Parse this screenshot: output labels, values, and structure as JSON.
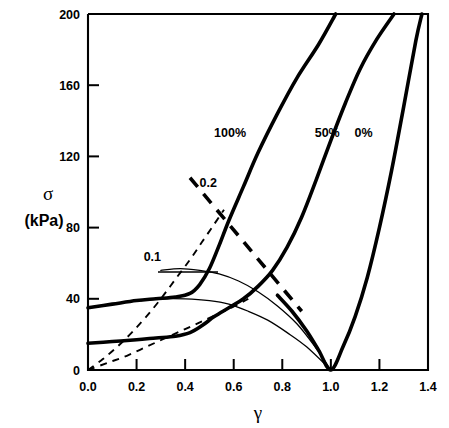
{
  "chart_data": {
    "type": "line",
    "title": "",
    "xlabel": "γ",
    "ylabel_symbol": "σ",
    "ylabel_units": "(kPa)",
    "xlim": [
      0.0,
      1.4
    ],
    "ylim": [
      0,
      200
    ],
    "xticks": [
      "0.0",
      "0.2",
      "0.4",
      "0.6",
      "0.8",
      "1.0",
      "1.2",
      "1.4"
    ],
    "xtick_values": [
      0.0,
      0.2,
      0.4,
      0.6,
      0.8,
      1.0,
      1.2,
      1.4
    ],
    "yticks": [
      "0",
      "40",
      "80",
      "120",
      "160",
      "200"
    ],
    "ytick_values": [
      0,
      40,
      80,
      120,
      160,
      200
    ],
    "grid": false,
    "legend": "inline-annotations",
    "annotations": [
      {
        "text": "100%",
        "x": 0.585,
        "y": 131,
        "style": "bold"
      },
      {
        "text": "50%",
        "x": 0.985,
        "y": 131,
        "style": "bold"
      },
      {
        "text": "0%",
        "x": 1.135,
        "y": 131,
        "style": "bold"
      },
      {
        "text": "0.2",
        "x": 0.495,
        "y": 103,
        "style": "bold"
      },
      {
        "text": "0.1",
        "x": 0.265,
        "y": 61,
        "style": "bold"
      }
    ],
    "series": [
      {
        "name": "100%",
        "style": "thick-solid",
        "comment": "saturation 100% - rises steeply after gamma 0.45",
        "points": [
          [
            0.0,
            35
          ],
          [
            0.1,
            37
          ],
          [
            0.2,
            39
          ],
          [
            0.28,
            40
          ],
          [
            0.36,
            41
          ],
          [
            0.42,
            43
          ],
          [
            0.46,
            48
          ],
          [
            0.5,
            57
          ],
          [
            0.54,
            70
          ],
          [
            0.58,
            84
          ],
          [
            0.64,
            103
          ],
          [
            0.7,
            122
          ],
          [
            0.78,
            144
          ],
          [
            0.86,
            164
          ],
          [
            0.95,
            183
          ],
          [
            1.02,
            200
          ]
        ]
      },
      {
        "name": "50%",
        "style": "thick-solid",
        "comment": "saturation 50% - dips to 0 at gamma=1 then rises",
        "points": [
          [
            0.0,
            15
          ],
          [
            0.1,
            16
          ],
          [
            0.2,
            17
          ],
          [
            0.28,
            18
          ],
          [
            0.36,
            19
          ],
          [
            0.42,
            21
          ],
          [
            0.47,
            25
          ],
          [
            0.52,
            30
          ],
          [
            0.58,
            35
          ],
          [
            0.64,
            40
          ],
          [
            0.7,
            47
          ],
          [
            0.76,
            56
          ],
          [
            0.82,
            69
          ],
          [
            0.88,
            86
          ],
          [
            0.94,
            107
          ],
          [
            1.0,
            129
          ],
          [
            1.06,
            150
          ],
          [
            1.12,
            169
          ],
          [
            1.19,
            186
          ],
          [
            1.26,
            200
          ]
        ]
      },
      {
        "name": "0%",
        "style": "thick-solid",
        "comment": "saturation 0% - reaches zero at gamma=1 then rises steeply",
        "points": [
          [
            0.78,
            42
          ],
          [
            0.84,
            33
          ],
          [
            0.9,
            22
          ],
          [
            0.95,
            11
          ],
          [
            1.0,
            0
          ],
          [
            1.05,
            13
          ],
          [
            1.1,
            30
          ],
          [
            1.15,
            52
          ],
          [
            1.2,
            80
          ],
          [
            1.25,
            112
          ],
          [
            1.3,
            148
          ],
          [
            1.35,
            185
          ],
          [
            1.375,
            200
          ]
        ]
      },
      {
        "name": "thin-upper-envelope",
        "style": "thin-solid",
        "comment": "thin curve labelled 0.1, peaks ~57 near gamma 0.35, decays to 0 at gamma 1",
        "points": [
          [
            0.3,
            56
          ],
          [
            0.38,
            57
          ],
          [
            0.46,
            56
          ],
          [
            0.54,
            54
          ],
          [
            0.62,
            50
          ],
          [
            0.7,
            44
          ],
          [
            0.78,
            36
          ],
          [
            0.86,
            26
          ],
          [
            0.93,
            14
          ],
          [
            1.0,
            0
          ]
        ]
      },
      {
        "name": "thin-lower-envelope",
        "style": "thin-solid",
        "comment": "thin curve peaking ~40 near gamma 0.27, decays to 0 at gamma 1",
        "points": [
          [
            0.22,
            39
          ],
          [
            0.3,
            40
          ],
          [
            0.4,
            40
          ],
          [
            0.5,
            39
          ],
          [
            0.58,
            37
          ],
          [
            0.66,
            33
          ],
          [
            0.74,
            28
          ],
          [
            0.82,
            21
          ],
          [
            0.9,
            13
          ],
          [
            1.0,
            0
          ]
        ]
      },
      {
        "name": "fine-dashed-upper",
        "style": "fine-dashed",
        "comment": "light dashed line from origin rising steeply, crosses 100% curve near gamma 0.5",
        "points": [
          [
            0.0,
            0
          ],
          [
            0.06,
            6
          ],
          [
            0.12,
            13
          ],
          [
            0.18,
            21
          ],
          [
            0.24,
            30
          ],
          [
            0.3,
            40
          ],
          [
            0.36,
            51
          ],
          [
            0.42,
            62
          ],
          [
            0.47,
            72
          ],
          [
            0.52,
            82
          ],
          [
            0.56,
            90
          ]
        ]
      },
      {
        "name": "fine-dashed-lower",
        "style": "fine-dashed",
        "comment": "light dashed line from origin with lower slope, crosses 50% curve near gamma 0.65",
        "points": [
          [
            0.0,
            0
          ],
          [
            0.08,
            4
          ],
          [
            0.16,
            8
          ],
          [
            0.24,
            13
          ],
          [
            0.32,
            18
          ],
          [
            0.4,
            23
          ],
          [
            0.48,
            28
          ],
          [
            0.56,
            33
          ],
          [
            0.62,
            37
          ],
          [
            0.66,
            40
          ]
        ]
      },
      {
        "name": "0.2-heavy-dashed",
        "style": "heavy-dashed",
        "comment": "heavy dashed straight line descending left to right, labelled 0.2",
        "points": [
          [
            0.42,
            108
          ],
          [
            0.52,
            92
          ],
          [
            0.62,
            76
          ],
          [
            0.72,
            60
          ],
          [
            0.82,
            43
          ],
          [
            0.88,
            33
          ]
        ]
      }
    ]
  }
}
